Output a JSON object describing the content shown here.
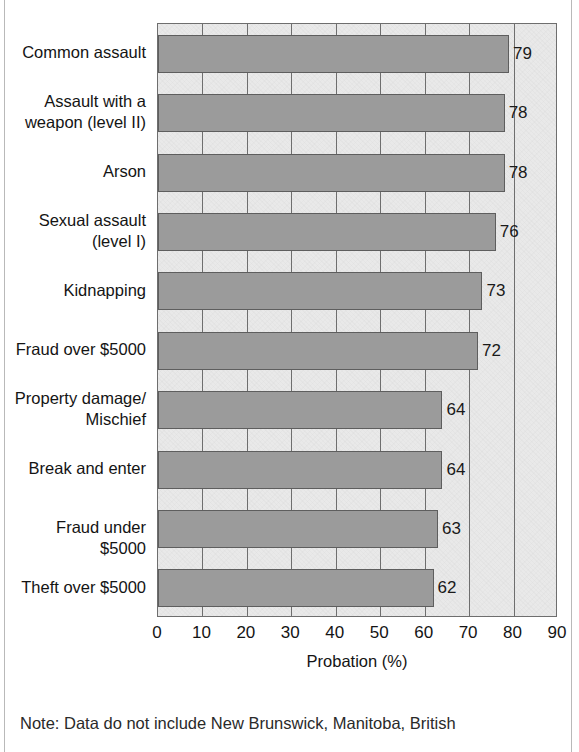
{
  "chart_data": {
    "type": "bar",
    "orientation": "horizontal",
    "title": "",
    "xlabel": "Probation (%)",
    "ylabel": "",
    "xlim": [
      0,
      90
    ],
    "xticks": [
      0,
      10,
      20,
      30,
      40,
      50,
      60,
      70,
      80,
      90
    ],
    "grid": "vertical",
    "legend": "none",
    "categories": [
      "Common assault",
      "Assault with a\nweapon (level II)",
      "Arson",
      "Sexual assault\n(level I)",
      "Kidnapping",
      "Fraud over $5000",
      "Property damage/\nMischief",
      "Break and enter",
      "Fraud under $5000",
      "Theft over $5000"
    ],
    "values": [
      79,
      78,
      78,
      76,
      73,
      72,
      64,
      64,
      63,
      62
    ],
    "value_labels": [
      "79",
      "78",
      "78",
      "76",
      "73",
      "72",
      "64",
      "64",
      "63",
      "62"
    ],
    "bar_color": "#9b9b9b",
    "bar_edge_color": "#5e5e5e",
    "plot_background": "#e9e9e9",
    "axis_color": "#6e6e6e"
  },
  "axis": {
    "tick_labels": [
      "0",
      "10",
      "20",
      "30",
      "40",
      "50",
      "60",
      "70",
      "80",
      "90"
    ],
    "title": "Probation (%)"
  },
  "footnote": {
    "text": "Note: Data do not include New Brunswick, Manitoba, British"
  }
}
